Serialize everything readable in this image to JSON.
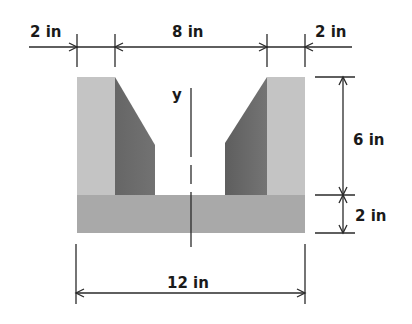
{
  "diagram": {
    "axis": {
      "label": "y"
    },
    "dimensions": {
      "top_left_flange": "2 in",
      "top_gap": "8 in",
      "top_right_flange": "2 in",
      "right_web_height": "6 in",
      "right_base_height": "2 in",
      "bottom_total_width": "12 in"
    },
    "colors": {
      "flange_light": "#c4c4c4",
      "flange_dark": "#6a6a6a",
      "flange_dark_edge": "#7c7c7c",
      "base": "#a9a9a9",
      "line": "#2a2a2a",
      "text": "#1a1a1a"
    }
  }
}
